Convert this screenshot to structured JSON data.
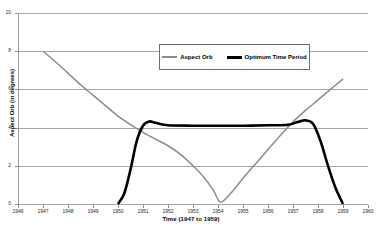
{
  "chart_data": {
    "type": "line",
    "title": "",
    "xlabel": "Time (1947 to 1959)",
    "ylabel": "Aspect Orb (in degrees)",
    "xlim": [
      1946,
      1960
    ],
    "ylim": [
      0,
      10
    ],
    "grid": true,
    "legend_position": "top-center",
    "x_ticks": [
      "1946",
      "1947",
      "1948",
      "1949",
      "1950",
      "1951",
      "1952",
      "1953",
      "1954",
      "1955",
      "1956",
      "1957",
      "1958",
      "1959",
      "1960"
    ],
    "y_ticks": [
      "0",
      "2",
      "4",
      "6",
      "8",
      "10"
    ],
    "series": [
      {
        "name": "Aspect Orb",
        "color": "#8c8c8c",
        "width": 1.5,
        "x": [
          1947.0,
          1947.5,
          1948.0,
          1948.5,
          1949.0,
          1949.5,
          1950.0,
          1950.5,
          1951.0,
          1951.5,
          1952.0,
          1952.5,
          1953.0,
          1953.4,
          1953.8,
          1954.1,
          1954.5,
          1955.0,
          1955.5,
          1956.0,
          1956.5,
          1957.0,
          1957.5,
          1958.0,
          1958.5,
          1959.0
        ],
        "values": [
          8.0,
          7.45,
          6.85,
          6.25,
          5.7,
          5.15,
          4.6,
          4.15,
          3.75,
          3.4,
          3.05,
          2.6,
          2.0,
          1.45,
          0.75,
          0.1,
          0.55,
          1.35,
          2.1,
          2.85,
          3.6,
          4.3,
          4.9,
          5.45,
          6.0,
          6.55
        ]
      },
      {
        "name": "Optimum Time Period",
        "color": "#000000",
        "width": 2.6,
        "x": [
          1950.0,
          1950.25,
          1950.5,
          1950.75,
          1951.0,
          1951.25,
          1951.5,
          1952.0,
          1953.0,
          1954.0,
          1955.0,
          1956.0,
          1956.8,
          1957.2,
          1957.5,
          1957.8,
          1958.1,
          1958.4,
          1958.7,
          1959.0
        ],
        "values": [
          0.0,
          0.55,
          1.8,
          3.3,
          4.1,
          4.32,
          4.25,
          4.12,
          4.1,
          4.1,
          4.1,
          4.12,
          4.15,
          4.3,
          4.38,
          4.2,
          3.3,
          2.0,
          0.85,
          0.0
        ]
      }
    ]
  },
  "legend": {
    "entries": [
      {
        "label": "Aspect Orb",
        "style": "thin"
      },
      {
        "label": "Optimum Time Period",
        "style": "thick"
      }
    ]
  }
}
